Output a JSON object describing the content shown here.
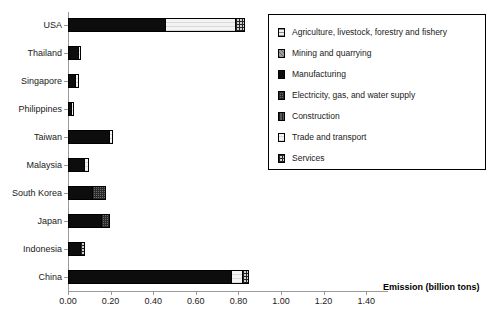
{
  "chart_data": {
    "type": "bar",
    "orientation": "horizontal",
    "stacked": true,
    "title": "",
    "xlabel": "Emission (billion tons)",
    "ylabel": "",
    "xlim": [
      0.0,
      1.5
    ],
    "xticks": [
      "0.00",
      "0.20",
      "0.40",
      "0.60",
      "0.80",
      "1.00",
      "1.20",
      "1.40"
    ],
    "xtick_values": [
      0.0,
      0.2,
      0.4,
      0.6,
      0.8,
      1.0,
      1.2,
      1.4
    ],
    "grid": false,
    "legend_position": "upper right",
    "categories": [
      "USA",
      "Thailand",
      "Singapore",
      "Philippines",
      "Taiwan",
      "Malaysia",
      "South Korea",
      "Japan",
      "Indonesia",
      "China"
    ],
    "series": [
      {
        "name": "Agriculture, livestock, forestry and fishery",
        "pattern": "agriculture",
        "values": [
          0.0,
          0.0,
          0.0,
          0.0,
          0.0,
          0.0,
          0.0,
          0.0,
          0.0,
          0.0
        ]
      },
      {
        "name": "Mining and quarrying",
        "pattern": "mining",
        "values": [
          0.0,
          0.0,
          0.0,
          0.0,
          0.0,
          0.0,
          0.0,
          0.0,
          0.0,
          0.0
        ]
      },
      {
        "name": "Manufacturing",
        "pattern": "manufacturing",
        "values": [
          0.45,
          0.04,
          0.03,
          0.01,
          0.19,
          0.07,
          0.11,
          0.15,
          0.05,
          0.76
        ]
      },
      {
        "name": "Electricity, gas, and water supply",
        "pattern": "electricity",
        "values": [
          0.0,
          0.0,
          0.0,
          0.0,
          0.0,
          0.0,
          0.0,
          0.0,
          0.0,
          0.0
        ]
      },
      {
        "name": "Construction",
        "pattern": "construction",
        "values": [
          0.0,
          0.0,
          0.0,
          0.0,
          0.0,
          0.0,
          0.0,
          0.0,
          0.0,
          0.0
        ]
      },
      {
        "name": "Trade and transport",
        "pattern": "trade",
        "values": [
          0.33,
          0.01,
          0.01,
          0.01,
          0.01,
          0.02,
          0.06,
          0.04,
          0.01,
          0.05
        ]
      },
      {
        "name": "Services",
        "pattern": "services",
        "values": [
          0.04,
          0.0,
          0.0,
          0.0,
          0.0,
          0.0,
          0.0,
          0.0,
          0.01,
          0.03
        ]
      }
    ],
    "totals": [
      0.82,
      0.05,
      0.04,
      0.02,
      0.2,
      0.09,
      0.17,
      0.19,
      0.07,
      0.84
    ],
    "bars": [
      {
        "category": "USA",
        "segments": [
          {
            "series": "Manufacturing",
            "pattern": "manufacturing",
            "value": 0.45
          },
          {
            "series": "Trade and transport",
            "pattern": "trade",
            "value": 0.33
          },
          {
            "series": "Services",
            "pattern": "services",
            "value": 0.04
          }
        ]
      },
      {
        "category": "Thailand",
        "segments": [
          {
            "series": "Manufacturing",
            "pattern": "manufacturing",
            "value": 0.04
          },
          {
            "series": "Trade and transport",
            "pattern": "trade",
            "value": 0.01
          }
        ]
      },
      {
        "category": "Singapore",
        "segments": [
          {
            "series": "Manufacturing",
            "pattern": "manufacturing",
            "value": 0.03
          },
          {
            "series": "Trade and transport",
            "pattern": "trade",
            "value": 0.01
          }
        ]
      },
      {
        "category": "Philippines",
        "segments": [
          {
            "series": "Manufacturing",
            "pattern": "manufacturing",
            "value": 0.01
          },
          {
            "series": "Trade and transport",
            "pattern": "trade",
            "value": 0.01
          }
        ]
      },
      {
        "category": "Taiwan",
        "segments": [
          {
            "series": "Manufacturing",
            "pattern": "manufacturing",
            "value": 0.19
          },
          {
            "series": "Trade and transport",
            "pattern": "trade",
            "value": 0.01
          }
        ]
      },
      {
        "category": "Malaysia",
        "segments": [
          {
            "series": "Manufacturing",
            "pattern": "manufacturing",
            "value": 0.07
          },
          {
            "series": "Trade and transport",
            "pattern": "trade",
            "value": 0.02
          }
        ]
      },
      {
        "category": "South Korea",
        "segments": [
          {
            "series": "Manufacturing",
            "pattern": "manufacturing",
            "value": 0.11
          },
          {
            "series": "Electricity, gas, and water supply",
            "pattern": "electricity",
            "value": 0.06
          }
        ]
      },
      {
        "category": "Japan",
        "segments": [
          {
            "series": "Manufacturing",
            "pattern": "manufacturing",
            "value": 0.15
          },
          {
            "series": "Electricity, gas, and water supply",
            "pattern": "electricity",
            "value": 0.04
          }
        ]
      },
      {
        "category": "Indonesia",
        "segments": [
          {
            "series": "Manufacturing",
            "pattern": "manufacturing",
            "value": 0.05
          },
          {
            "series": "Services",
            "pattern": "services",
            "value": 0.02
          }
        ]
      },
      {
        "category": "China",
        "segments": [
          {
            "series": "Manufacturing",
            "pattern": "manufacturing",
            "value": 0.76
          },
          {
            "series": "Trade and transport",
            "pattern": "trade",
            "value": 0.05
          },
          {
            "series": "Services",
            "pattern": "services",
            "value": 0.03
          }
        ]
      }
    ]
  },
  "legend": {
    "items": [
      {
        "label": "Agriculture, livestock, forestry and fishery",
        "pattern": "agriculture"
      },
      {
        "label": "Mining and quarrying",
        "pattern": "mining"
      },
      {
        "label": "Manufacturing",
        "pattern": "manufacturing"
      },
      {
        "label": "Electricity, gas, and water supply",
        "pattern": "electricity"
      },
      {
        "label": "Construction",
        "pattern": "construction"
      },
      {
        "label": "Trade and transport",
        "pattern": "trade"
      },
      {
        "label": "Services",
        "pattern": "services"
      }
    ]
  },
  "colors": {
    "axis": "#9a9a9a",
    "text": "#1a1a1a",
    "bar_outline": "#000000",
    "manufacturing": "#0d0d0d",
    "trade": "#f3f3f3",
    "services": "#cfcfcf",
    "electricity": "#6e6e6e"
  }
}
